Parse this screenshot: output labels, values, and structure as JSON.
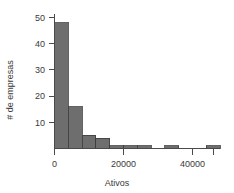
{
  "chart_data": {
    "type": "bar",
    "title": "",
    "subtitle": "",
    "xlabel": "Ativos",
    "ylabel": "# de empresas",
    "xlim": [
      -2000,
      58000
    ],
    "ylim": [
      0,
      52
    ],
    "grid": false,
    "legend": null,
    "bar_color": "#6e6e6e",
    "bar_edge_color": "#3c3c3c",
    "axis_color": "#4a4a4a",
    "bin_width": 4000,
    "x_ticks": [
      0,
      20000,
      40000
    ],
    "x_tick_labels": [
      "0",
      "20000",
      "40000"
    ],
    "y_ticks": [
      10,
      20,
      30,
      40,
      50
    ],
    "y_tick_labels": [
      "10",
      "20",
      "30",
      "40",
      "50"
    ],
    "bins": [
      {
        "x0": 0,
        "x1": 4000,
        "value": 48
      },
      {
        "x0": 4000,
        "x1": 8000,
        "value": 16
      },
      {
        "x0": 8000,
        "x1": 12000,
        "value": 5
      },
      {
        "x0": 12000,
        "x1": 16000,
        "value": 4
      },
      {
        "x0": 16000,
        "x1": 20000,
        "value": 1
      },
      {
        "x0": 20000,
        "x1": 24000,
        "value": 1
      },
      {
        "x0": 24000,
        "x1": 28000,
        "value": 1
      },
      {
        "x0": 32000,
        "x1": 36000,
        "value": 1
      },
      {
        "x0": 44000,
        "x1": 48000,
        "value": 1
      },
      {
        "x0": 52000,
        "x1": 56000,
        "value": 1
      }
    ],
    "categories": [
      "0-4000",
      "4000-8000",
      "8000-12000",
      "12000-16000",
      "16000-20000",
      "20000-24000",
      "24000-28000",
      "32000-36000",
      "44000-48000",
      "52000-56000"
    ],
    "values": [
      48,
      16,
      5,
      4,
      1,
      1,
      1,
      1,
      1,
      1
    ]
  }
}
